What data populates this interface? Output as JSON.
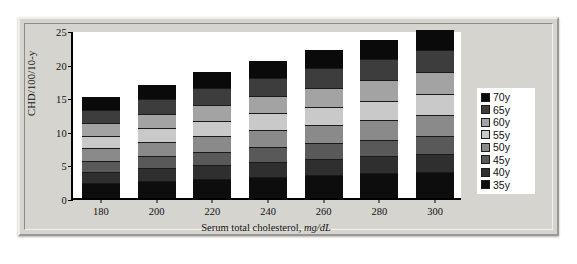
{
  "chart_data": {
    "type": "bar",
    "stacked": true,
    "title": "",
    "xlabel": "Serum total cholesterol, mg/dL",
    "xlabel_plain": "Serum total cholesterol,",
    "xlabel_italic": "mg/dL",
    "ylabel": "CHD/100/10-y",
    "categories": [
      "180",
      "200",
      "220",
      "240",
      "260",
      "280",
      "300"
    ],
    "ylim": [
      0,
      25
    ],
    "yticks": [
      "0",
      "5",
      "10",
      "15",
      "20",
      "25"
    ],
    "grid": false,
    "legend_position": "right",
    "totals": [
      15.0,
      16.8,
      18.8,
      20.4,
      22.0,
      23.5,
      25.0
    ],
    "series": [
      {
        "name": "35y",
        "color": "#0d0d0d",
        "values": [
          2.3,
          2.6,
          2.9,
          3.2,
          3.4,
          3.7,
          3.9
        ]
      },
      {
        "name": "40y",
        "color": "#2f2f2f",
        "values": [
          1.6,
          1.8,
          2.0,
          2.2,
          2.4,
          2.5,
          2.7
        ]
      },
      {
        "name": "45y",
        "color": "#595959",
        "values": [
          1.6,
          1.8,
          2.0,
          2.2,
          2.4,
          2.5,
          2.7
        ]
      },
      {
        "name": "50y",
        "color": "#8a8a8a",
        "values": [
          1.9,
          2.1,
          2.3,
          2.5,
          2.7,
          2.9,
          3.1
        ]
      },
      {
        "name": "55y",
        "color": "#c9c9c9",
        "values": [
          1.9,
          2.1,
          2.3,
          2.5,
          2.7,
          2.9,
          3.1
        ]
      },
      {
        "name": "60y",
        "color": "#a3a3a3",
        "values": [
          1.9,
          2.1,
          2.4,
          2.6,
          2.8,
          3.0,
          3.2
        ]
      },
      {
        "name": "65y",
        "color": "#3d3d3d",
        "values": [
          1.9,
          2.2,
          2.5,
          2.7,
          3.0,
          3.2,
          3.4
        ]
      },
      {
        "name": "70y",
        "color": "#0a0a0a",
        "values": [
          1.9,
          2.1,
          2.4,
          2.5,
          2.6,
          2.8,
          2.9
        ]
      }
    ],
    "legend": [
      {
        "label": "70y",
        "color": "#0a0a0a"
      },
      {
        "label": "65y",
        "color": "#3d3d3d"
      },
      {
        "label": "60y",
        "color": "#a3a3a3"
      },
      {
        "label": "55y",
        "color": "#c9c9c9"
      },
      {
        "label": "50y",
        "color": "#8a8a8a"
      },
      {
        "label": "45y",
        "color": "#595959"
      },
      {
        "label": "40y",
        "color": "#2f2f2f"
      },
      {
        "label": "35y",
        "color": "#0d0d0d"
      }
    ]
  }
}
